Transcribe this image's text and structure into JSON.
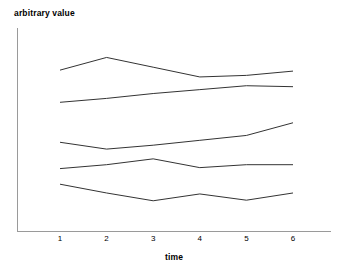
{
  "chart_data": {
    "type": "line",
    "title": "",
    "xlabel": "time",
    "ylabel": "arbitrary value",
    "x": [
      1,
      2,
      3,
      4,
      5,
      6
    ],
    "xticklabels": [
      "1",
      "2",
      "3",
      "4",
      "5",
      "6"
    ],
    "xlim": [
      0.72,
      6.35
    ],
    "ylim": [
      0,
      100
    ],
    "grid": false,
    "legend": false,
    "legend_position": "none",
    "axis_style": "left-and-bottom-spines-only",
    "line_color": "#333333",
    "series": [
      {
        "name": "series-1",
        "values": [
          82.5,
          89.0,
          84.0,
          79.0,
          79.8,
          82.0
        ]
      },
      {
        "name": "series-2",
        "values": [
          66.0,
          68.0,
          70.5,
          72.5,
          74.5,
          74.0
        ]
      },
      {
        "name": "series-3",
        "values": [
          45.5,
          42.0,
          44.0,
          46.5,
          49.0,
          55.5
        ]
      },
      {
        "name": "series-4",
        "values": [
          32.0,
          34.0,
          37.0,
          32.5,
          34.0,
          34.0
        ]
      },
      {
        "name": "series-5",
        "values": [
          24.0,
          19.5,
          15.5,
          19.0,
          15.8,
          19.5
        ]
      }
    ]
  }
}
